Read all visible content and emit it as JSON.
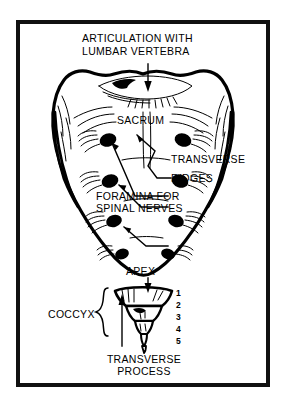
{
  "figure": {
    "background_color": "#ffffff",
    "ink_color": "#000000",
    "frame": {
      "color": "#111111",
      "thickness_px": 4
    }
  },
  "labels": {
    "articulation_line1": "ARTICULATION WITH",
    "articulation_line2": "LUMBAR VERTEBRA",
    "sacrum": "SACRUM",
    "transverse_ridges_line1": "TRANSVERSE",
    "transverse_ridges_line2": "RIDGES",
    "foramina_line1": "FORAMINA FOR",
    "foramina_line2": "SPINAL NERVES",
    "apex": "APEX",
    "coccyx": "COCCYX",
    "transverse_process_line1": "TRANSVERSE",
    "transverse_process_line2": "PROCESS"
  },
  "coccyx_numbers": [
    "1",
    "2",
    "3",
    "4",
    "5"
  ],
  "anatomy": {
    "foramina_pairs": 4,
    "coccyx_segments": 5,
    "leader_arrow_style": "thin line with solid arrowhead"
  }
}
